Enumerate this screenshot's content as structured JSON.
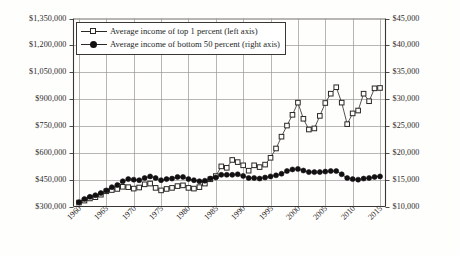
{
  "chart_data": {
    "type": "line",
    "title": "",
    "subtitle": "",
    "xlabel": "",
    "ylabel": "",
    "grid": true,
    "legend_position": "top-left",
    "x": [
      1960,
      1961,
      1962,
      1963,
      1964,
      1965,
      1966,
      1967,
      1968,
      1969,
      1970,
      1971,
      1972,
      1973,
      1974,
      1975,
      1976,
      1977,
      1978,
      1979,
      1980,
      1981,
      1982,
      1983,
      1984,
      1985,
      1986,
      1987,
      1988,
      1989,
      1990,
      1991,
      1992,
      1993,
      1994,
      1995,
      1996,
      1997,
      1998,
      1999,
      2000,
      2001,
      2002,
      2003,
      2004,
      2005,
      2006,
      2007,
      2008,
      2009,
      2010,
      2011,
      2012,
      2013,
      2014,
      2015
    ],
    "xticks": [
      1960,
      1965,
      1970,
      1975,
      1980,
      1985,
      1990,
      1995,
      2000,
      2005,
      2010,
      2015
    ],
    "xtick_labels": [
      "1960",
      "1965",
      "1970",
      "1975",
      "1980",
      "1985",
      "1990",
      "1995",
      "2000",
      "2005",
      "2010",
      "2015"
    ],
    "xlim": [
      1959,
      2016
    ],
    "left_axis": {
      "label": "",
      "ylim": [
        300000,
        1350000
      ],
      "yticks": [
        300000,
        450000,
        600000,
        750000,
        900000,
        1050000,
        1200000,
        1350000
      ],
      "ytick_labels": [
        "$300,000",
        "$450,000",
        "$600,000",
        "$750,000",
        "$900,000",
        "$1,050,000",
        "$1,200,000",
        "$1,350,000"
      ]
    },
    "right_axis": {
      "label": "",
      "ylim": [
        10000,
        45000
      ],
      "yticks": [
        10000,
        15000,
        20000,
        25000,
        30000,
        35000,
        40000,
        45000
      ],
      "ytick_labels": [
        "$10,000",
        "$15,000",
        "$20,000",
        "$25,000",
        "$30,000",
        "$35,000",
        "$40,000",
        "$45,000"
      ]
    },
    "series": [
      {
        "name": "Average income of top 1 percent (left axis)",
        "legend_label": "Average income of top 1 percent (left axis)",
        "axis": "left",
        "marker": "open-square",
        "color": "#2b2725",
        "values": [
          322000,
          333000,
          345000,
          352000,
          366000,
          385000,
          392000,
          398000,
          410000,
          408000,
          400000,
          406000,
          424000,
          428000,
          404000,
          390000,
          398000,
          404000,
          414000,
          418000,
          404000,
          400000,
          408000,
          428000,
          452000,
          470000,
          524000,
          516000,
          560000,
          548000,
          530000,
          500000,
          530000,
          520000,
          534000,
          572000,
          624000,
          690000,
          752000,
          812000,
          880000,
          790000,
          730000,
          736000,
          806000,
          878000,
          930000,
          966000,
          880000,
          760000,
          820000,
          836000,
          930000,
          888000,
          960000,
          962000
        ]
      },
      {
        "name": "Average income of bottom 50 percent (right axis)",
        "legend_label": "Average income of bottom 50 percent (right axis)",
        "axis": "right",
        "marker": "filled-circle",
        "color": "#121010",
        "values": [
          10800,
          11400,
          11800,
          12100,
          12500,
          13000,
          13600,
          14000,
          14700,
          15100,
          15000,
          14900,
          15300,
          15600,
          15300,
          14900,
          15100,
          15200,
          15500,
          15500,
          15100,
          14900,
          14700,
          14800,
          15200,
          15400,
          15900,
          15900,
          15900,
          16000,
          15700,
          15300,
          15300,
          15200,
          15400,
          15600,
          15800,
          16100,
          16600,
          16900,
          17000,
          16700,
          16400,
          16400,
          16400,
          16500,
          16600,
          16600,
          16000,
          15300,
          15100,
          15000,
          15200,
          15300,
          15500,
          15600
        ]
      }
    ]
  },
  "legend": {
    "items": [
      {
        "label": "Average income of top 1 percent (left axis)",
        "marker": "open-square"
      },
      {
        "label": "Average income of bottom 50 percent (right axis)",
        "marker": "filled-circle"
      }
    ]
  },
  "colors": {
    "background": "#fefefd",
    "axis": "#3a3634",
    "grid": "#9a9694",
    "text": "#231f1e",
    "series_top": "#2b2725",
    "series_bottom": "#121010"
  }
}
